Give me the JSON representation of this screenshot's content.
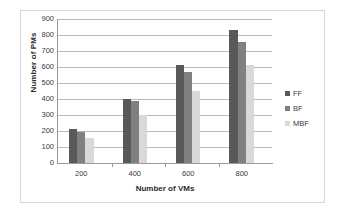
{
  "chart_data": {
    "type": "bar",
    "title": "",
    "xlabel": "Number of VMs",
    "ylabel": "Number of PMs",
    "categories": [
      "200",
      "400",
      "600",
      "800"
    ],
    "series": [
      {
        "name": "FF",
        "values": [
          210,
          403,
          615,
          830
        ],
        "color": "#595959"
      },
      {
        "name": "BF",
        "values": [
          197,
          388,
          570,
          755
        ],
        "color": "#808080"
      },
      {
        "name": "MBF",
        "values": [
          155,
          302,
          450,
          613
        ],
        "color": "#d9d9d9"
      }
    ],
    "ylim": [
      0,
      900
    ],
    "ytick_labels": [
      "0",
      "100",
      "200",
      "300",
      "400",
      "500",
      "600",
      "700",
      "800",
      "900"
    ],
    "ytick_values": [
      0,
      100,
      200,
      300,
      400,
      500,
      600,
      700,
      800,
      900
    ],
    "grid": true,
    "grid_axis": "y",
    "legend_position": "right",
    "legend_entries": [
      "FF",
      "BF",
      "MBF"
    ]
  },
  "figure": {
    "background_color": "#ffffff",
    "frame_color": "#d6d6d6",
    "axis_color": "#9a9a9a",
    "grid_color": "#b8b8b8",
    "text_color": "#3b3b3b"
  }
}
